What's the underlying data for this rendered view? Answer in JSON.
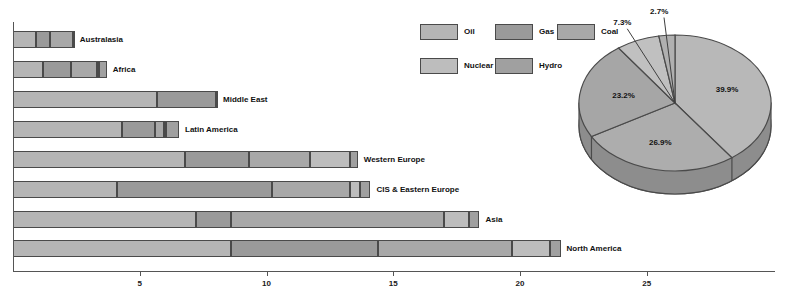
{
  "legend": {
    "items": [
      {
        "label": "Oil",
        "color": "#b5b5b5"
      },
      {
        "label": "Gas",
        "color": "#9a9a9a"
      },
      {
        "label": "Coal",
        "color": "#a8a8a8"
      },
      {
        "label": "Nuclear",
        "color": "#bdbdbd"
      },
      {
        "label": "Hydro",
        "color": "#a0a0a0"
      }
    ]
  },
  "chart_data": [
    {
      "type": "bar",
      "orientation": "horizontal",
      "stacked": true,
      "title": "",
      "xlabel": "",
      "ylabel": "",
      "xlim": [
        0,
        28.5
      ],
      "grid": false,
      "xticks": [
        5,
        10,
        15,
        20,
        25
      ],
      "xtick_labels": [
        "5",
        "10",
        "15",
        "20",
        "25"
      ],
      "categories": [
        "North America",
        "Asia",
        "CIS & Eastern Europe",
        "Western Europe",
        "Latin America",
        "Middle East",
        "Africa",
        "Australasia"
      ],
      "series": [
        {
          "name": "Oil",
          "values": [
            8.6,
            7.2,
            4.1,
            6.8,
            4.3,
            5.7,
            1.2,
            0.9
          ]
        },
        {
          "name": "Gas",
          "values": [
            5.8,
            1.4,
            6.1,
            2.5,
            1.3,
            2.3,
            1.1,
            0.55
          ]
        },
        {
          "name": "Coal",
          "values": [
            5.3,
            8.4,
            3.1,
            2.4,
            0.35,
            0.0,
            1.0,
            0.9
          ]
        },
        {
          "name": "Nuclear",
          "values": [
            1.5,
            1.0,
            0.4,
            1.6,
            0.1,
            0.0,
            0.1,
            0.0
          ]
        },
        {
          "name": "Hydro",
          "values": [
            0.4,
            0.4,
            0.4,
            0.3,
            0.5,
            0.05,
            0.3,
            0.05
          ]
        }
      ],
      "totals": [
        21.6,
        18.4,
        14.1,
        13.6,
        6.55,
        8.05,
        3.7,
        2.4
      ]
    },
    {
      "type": "pie",
      "title": "",
      "three_d": true,
      "labels": [
        "Oil",
        "Coal",
        "Gas",
        "Nuclear",
        "Hydro"
      ],
      "values": [
        39.9,
        26.9,
        23.2,
        7.3,
        2.7
      ],
      "value_labels": [
        "39.9%",
        "26.9%",
        "23.2%",
        "7.3%",
        "2.7%"
      ],
      "legend_position": "left"
    }
  ]
}
